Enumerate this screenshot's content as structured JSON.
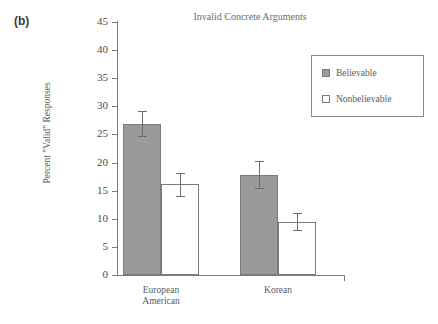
{
  "panel_label": "(b)",
  "chart_data": {
    "type": "bar",
    "title": "Invalid Concrete Arguments",
    "xlabel": "",
    "ylabel": "Percent \"Valid\" Responses",
    "ylim": [
      0,
      45
    ],
    "yticks": [
      0,
      5,
      10,
      15,
      20,
      25,
      30,
      35,
      40,
      45
    ],
    "ytick_labels": [
      "0",
      "5",
      "10",
      "15",
      "20",
      "25",
      "30",
      "35",
      "40",
      "45"
    ],
    "grid": false,
    "legend_position": "upper right",
    "categories": [
      "European American",
      "Korean"
    ],
    "category_lines": [
      [
        "European",
        "American"
      ],
      [
        "Korean"
      ]
    ],
    "series": [
      {
        "name": "Believable",
        "color": "#9a9a9a",
        "values": [
          26.9,
          17.8
        ],
        "errors": [
          2.2,
          2.4
        ]
      },
      {
        "name": "Nonbelievable",
        "color": "#ffffff",
        "values": [
          16.1,
          9.5
        ],
        "errors": [
          2.0,
          1.5
        ]
      }
    ]
  },
  "legend": {
    "items": [
      {
        "label": "Believable",
        "swatch": "filled"
      },
      {
        "label": "Nonbelievable",
        "swatch": "empty"
      }
    ]
  },
  "colors": {
    "bar_fill_believable": "#9a9a9a",
    "bar_fill_nonbelievable": "#ffffff",
    "bar_edge": "#7a7a7a",
    "axis": "#7d7d7d",
    "text": "#5a5a5a",
    "background": "#ffffff"
  }
}
